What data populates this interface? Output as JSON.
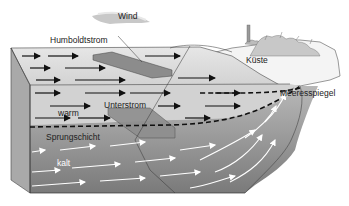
{
  "diagram": {
    "labels": {
      "wind": "Wind",
      "humboldtstrom": "Humboldtstrom",
      "kueste": "Küste",
      "meeresspiegel": "Meeresspiegel",
      "warm": "warm",
      "unterstrom": "Unterstrom",
      "sprungschicht": "Sprungschicht",
      "kalt": "kalt"
    },
    "colors": {
      "warm_water": "#dcdcdc",
      "cold_water": "#8a8a8a",
      "coast": "#f2f2f2",
      "arrows_warm": "#111111",
      "arrows_cold": "#ffffff"
    }
  }
}
